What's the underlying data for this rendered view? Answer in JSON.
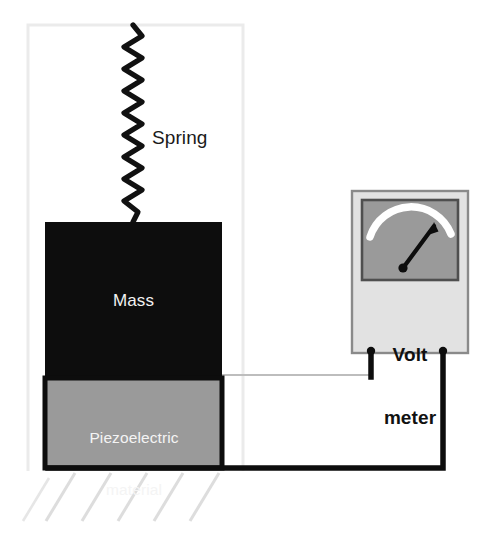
{
  "diagram": {
    "labels": {
      "spring": "Spring",
      "mass": "Mass",
      "piezo_line1": "Piezoelectric",
      "piezo_line2": "material",
      "volt_line1": "Volt",
      "volt_line2": "meter"
    },
    "colors": {
      "mass_fill": "#0d0d0d",
      "piezo_fill": "#9a9a9a",
      "piezo_border": "#0d0d0d",
      "meter_body": "#e2e2e2",
      "meter_body_border": "#7a7a7a",
      "meter_display": "#9a9a9a",
      "meter_display_border": "#4a4a4a",
      "needle": "#0d0d0d",
      "scale_arc": "#ffffff",
      "wire": "#0d0d0d",
      "faint_wire": "#b9b9b9",
      "frame": "#ebebeb",
      "hatch": "#dcdcdc",
      "spring": "#111111",
      "label_light": "#f2f2f2",
      "label_dark": "#1a1a1a"
    },
    "parts": {
      "frame": "support-frame",
      "spring": "spring-coil",
      "mass": "mass-block",
      "piezo": "piezoelectric-block",
      "ground": "ground-hatching",
      "meter": "volt-meter",
      "display": "meter-display",
      "arc": "meter-scale-arc",
      "needle": "meter-needle",
      "pivot": "meter-needle-pivot",
      "terminal_left": "meter-terminal-left",
      "terminal_right": "meter-terminal-right",
      "wire_top": "wire-top-lead",
      "wire_bottom": "wire-bottom-lead"
    }
  }
}
